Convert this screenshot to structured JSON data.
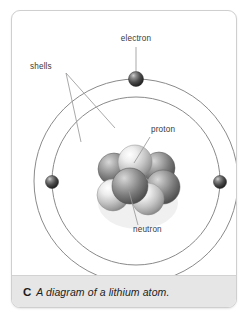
{
  "figure": {
    "caption_letter": "C",
    "caption_text": "A diagram of a lithium atom.",
    "subject": "lithium atom"
  },
  "diagram": {
    "type": "bohr-atom-model",
    "labels": {
      "electron": "electron",
      "shells": "shells",
      "proton": "proton",
      "neutron": "neutron"
    },
    "colors": {
      "shell_stroke": "#8a8a8a",
      "leader_line": "#9a9a9a",
      "label_text": "#3a3a3a",
      "electron_dark": "#3b3b3b",
      "proton_light": "#cfcfcf",
      "neutron_dark": "#6e6e6e",
      "card_border": "#cfcfcf",
      "caption_band": "#e6e6e6",
      "page_background": "#ffffff"
    },
    "counts": {
      "electrons": 3,
      "protons": 3,
      "neutrons": 4,
      "shells": 2
    },
    "shells": [
      {
        "name": "outer-shell",
        "cx": 124,
        "cy": 170,
        "r": 102
      },
      {
        "name": "inner-shell",
        "cx": 124,
        "cy": 170,
        "r": 84
      }
    ],
    "electrons": [
      {
        "name": "electron-top",
        "cx": 124,
        "cy": 68,
        "r": 7.5,
        "shell": "outer-shell"
      },
      {
        "name": "electron-left",
        "cx": 40,
        "cy": 171,
        "r": 6.5,
        "shell": "inner-shell"
      },
      {
        "name": "electron-right",
        "cx": 208,
        "cy": 171,
        "r": 6.5,
        "shell": "inner-shell"
      }
    ],
    "nucleus": {
      "center_x": 124,
      "center_y": 170,
      "particles": [
        {
          "name": "neutron-back-left",
          "cx": 102,
          "cy": 158,
          "r": 16,
          "kind": "neutron"
        },
        {
          "name": "neutron-back-right",
          "cx": 147,
          "cy": 157,
          "r": 16,
          "kind": "neutron"
        },
        {
          "name": "proton-top-center",
          "cx": 123,
          "cy": 151,
          "r": 17,
          "kind": "proton"
        },
        {
          "name": "neutron-mid-right",
          "cx": 151,
          "cy": 176,
          "r": 17,
          "kind": "neutron"
        },
        {
          "name": "proton-left-front",
          "cx": 101,
          "cy": 184,
          "r": 16,
          "kind": "proton"
        },
        {
          "name": "proton-front-right",
          "cx": 136,
          "cy": 188,
          "r": 16,
          "kind": "proton"
        },
        {
          "name": "neutron-front-center",
          "cx": 118,
          "cy": 175,
          "r": 18,
          "kind": "neutron"
        }
      ]
    },
    "annotations": [
      {
        "name": "electron-label",
        "text_x": 124,
        "text_y": 30,
        "anchor": "middle",
        "leader": [
          [
            124,
            36
          ],
          [
            124,
            60
          ]
        ]
      },
      {
        "name": "shells-label",
        "text_x": 18,
        "text_y": 58,
        "anchor": "start",
        "leader_a": [
          [
            54,
            62
          ],
          [
            103,
            117
          ]
        ],
        "leader_b": [
          [
            54,
            62
          ],
          [
            69,
            131
          ]
        ]
      },
      {
        "name": "proton-label",
        "text_x": 139,
        "text_y": 121,
        "anchor": "start",
        "leader": [
          [
            138,
            126
          ],
          [
            122,
            152
          ]
        ]
      },
      {
        "name": "neutron-label",
        "text_x": 121,
        "text_y": 221,
        "anchor": "start",
        "leader": [
          [
            126,
            214
          ],
          [
            117,
            180
          ]
        ]
      }
    ]
  }
}
